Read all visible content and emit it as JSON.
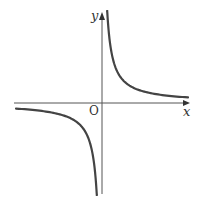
{
  "chart_data": {
    "type": "line",
    "title": "",
    "function": "y = k/x",
    "xlabel": "x",
    "ylabel": "y",
    "origin_label": "O",
    "grid": false,
    "series": [
      {
        "name": "branch-quadrant-1",
        "x_range": [
          0.05,
          1.0
        ]
      },
      {
        "name": "branch-quadrant-3",
        "x_range": [
          -1.0,
          -0.05
        ]
      }
    ]
  },
  "labels": {
    "x_axis": "x",
    "y_axis": "y",
    "origin": "O"
  },
  "colors": {
    "curve": "#444444",
    "axis": "#555555"
  }
}
